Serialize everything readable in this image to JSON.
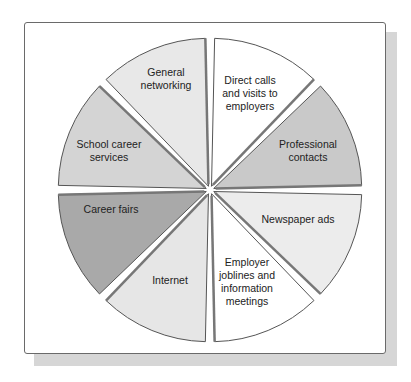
{
  "chart_data": {
    "type": "pie",
    "title": "",
    "center": [
      210,
      190
    ],
    "radius": 148,
    "segments": [
      {
        "label": "Direct calls\nand visits to\nemployers",
        "start": -90,
        "end": -45,
        "fill": "#ffffff"
      },
      {
        "label": "Professional\ncontacts",
        "start": -45,
        "end": 0,
        "fill": "#c9c9c9"
      },
      {
        "label": "Newspaper ads",
        "start": 0,
        "end": 45,
        "fill": "#ececec"
      },
      {
        "label": "Employer\njoblines and\ninformation\nmeetings",
        "start": 45,
        "end": 90,
        "fill": "#ffffff"
      },
      {
        "label": "Internet",
        "start": 90,
        "end": 135,
        "fill": "#e6e6e6"
      },
      {
        "label": "Career fairs",
        "start": 135,
        "end": 180,
        "fill": "#a9a9a9"
      },
      {
        "label": "School career\nservices",
        "start": 180,
        "end": 225,
        "fill": "#d4d4d4"
      },
      {
        "label": "General\nnetworking",
        "start": 225,
        "end": 270,
        "fill": "#e8e8e8"
      }
    ]
  },
  "labels": {
    "direct": "Direct calls\nand visits to\nemployers",
    "professional": "Professional\ncontacts",
    "newspaper": "Newspaper ads",
    "employer": "Employer\njoblines and\ninformation\nmeetings",
    "internet": "Internet",
    "career_fairs": "Career fairs",
    "school": "School career\nservices",
    "general": "General\nnetworking"
  }
}
